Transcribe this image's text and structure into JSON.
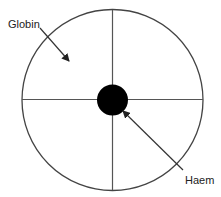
{
  "diagram": {
    "labels": {
      "globin": "Globin",
      "haem": "Haem"
    },
    "colors": {
      "stroke": "#444444",
      "core": "#000000",
      "text": "#222222"
    }
  }
}
